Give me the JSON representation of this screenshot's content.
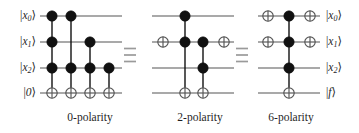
{
  "figure": {
    "width": 359,
    "height": 133,
    "background_color": "#ffffff",
    "wire_color": "#8c8c8c",
    "gate_color": "#111111",
    "equals_color": "#9a9a9a"
  },
  "wire_labels": {
    "left": [
      {
        "name": "x0",
        "base": "x",
        "sub": "0"
      },
      {
        "name": "x1",
        "base": "x",
        "sub": "1"
      },
      {
        "name": "x2",
        "base": "x",
        "sub": "2"
      },
      {
        "name": "zero",
        "base": "0",
        "sub": ""
      }
    ],
    "right": [
      {
        "name": "x0",
        "base": "x",
        "sub": "0"
      },
      {
        "name": "x1",
        "base": "x",
        "sub": "1"
      },
      {
        "name": "x2",
        "base": "x",
        "sub": "2"
      },
      {
        "name": "f",
        "base": "f",
        "sub": ""
      }
    ]
  },
  "captions": [
    {
      "name": "caption-0-polarity",
      "text": "0-polarity",
      "center_x": 90,
      "y": 112
    },
    {
      "name": "caption-2-polarity",
      "text": "2-polarity",
      "center_x": 200,
      "y": 112
    },
    {
      "name": "caption-6-polarity",
      "text": "6-polarity",
      "center_x": 291,
      "y": 112
    }
  ],
  "equals_signs": [
    {
      "name": "equals-sign-1",
      "x": 130,
      "y": 55
    },
    {
      "name": "equals-sign-2",
      "x": 242,
      "y": 55
    }
  ],
  "rows_y": [
    16,
    42,
    68,
    93
  ],
  "circuits": [
    {
      "name": "circuit-0-polarity",
      "label": "0-polarity",
      "wire_start": 40,
      "wire_end": 122,
      "columns": [
        {
          "name": "gate-col-1",
          "x": 52,
          "controls": [
            0,
            1,
            2
          ],
          "target_row": 3,
          "target": "xor"
        },
        {
          "name": "gate-col-2",
          "x": 71,
          "controls": [
            0,
            2
          ],
          "target_row": 3,
          "target": "xor"
        },
        {
          "name": "gate-col-3",
          "x": 90,
          "controls": [
            1,
            2
          ],
          "target_row": 3,
          "target": "xor"
        },
        {
          "name": "gate-col-4",
          "x": 109,
          "controls": [
            2
          ],
          "target_row": 3,
          "target": "xor"
        }
      ]
    },
    {
      "name": "circuit-2-polarity",
      "label": "2-polarity",
      "wire_start": 152,
      "wire_end": 234,
      "columns": [
        {
          "name": "gate-col-1",
          "x": 163,
          "controls": [],
          "target_row": 1,
          "target": "xor"
        },
        {
          "name": "gate-col-2",
          "x": 185,
          "controls": [
            0,
            1
          ],
          "target_row": 3,
          "target": "xor"
        },
        {
          "name": "gate-col-3",
          "x": 203,
          "controls": [
            1,
            2
          ],
          "target_row": 3,
          "target": "xor"
        },
        {
          "name": "gate-col-4",
          "x": 224,
          "controls": [],
          "target_row": 1,
          "target": "xor"
        }
      ]
    },
    {
      "name": "circuit-6-polarity",
      "label": "6-polarity",
      "wire_start": 258,
      "wire_end": 320,
      "columns": [
        {
          "name": "gate-col-1",
          "x": 268,
          "controls": [],
          "target_row": 0,
          "target": "xor"
        },
        {
          "name": "gate-col-1b",
          "x": 268,
          "controls": [],
          "target_row": 1,
          "target": "xor"
        },
        {
          "name": "gate-col-2",
          "x": 289,
          "controls": [
            0,
            1,
            2
          ],
          "target_row": 3,
          "target": "xor"
        },
        {
          "name": "gate-col-3",
          "x": 310,
          "controls": [],
          "target_row": 0,
          "target": "xor"
        },
        {
          "name": "gate-col-3b",
          "x": 310,
          "controls": [],
          "target_row": 1,
          "target": "xor"
        }
      ]
    }
  ],
  "geometry": {
    "control_radius": 5.2,
    "xor_radius": 5.2,
    "wire_stroke": 1.6,
    "link_stroke": 1.4
  }
}
